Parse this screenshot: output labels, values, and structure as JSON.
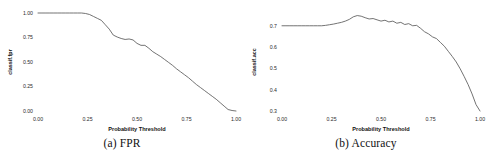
{
  "figure": {
    "panels": [
      {
        "id": "panel-fpr",
        "caption": "(a) FPR",
        "chart_data": {
          "type": "line",
          "title": "",
          "xlabel": "Probability Threshold",
          "ylabel": "classif.fpr",
          "xlim": [
            0.0,
            1.0
          ],
          "ylim": [
            0.0,
            1.0
          ],
          "xticks": [
            0.0,
            0.25,
            0.5,
            0.75,
            1.0
          ],
          "xticklabels": [
            "0.00",
            "0.25",
            "0.50",
            "0.75",
            "1.00"
          ],
          "yticks": [
            0.0,
            0.25,
            0.5,
            0.75,
            1.0
          ],
          "yticklabels": [
            "0.00",
            "0.25",
            "0.50",
            "0.75",
            "1.00"
          ],
          "grid": false,
          "legend": "none",
          "line_color": "#5a5a5a",
          "series": [
            {
              "name": "classif.fpr",
              "x": [
                0.0,
                0.02,
                0.04,
                0.06,
                0.08,
                0.1,
                0.12,
                0.14,
                0.16,
                0.18,
                0.2,
                0.22,
                0.24,
                0.26,
                0.28,
                0.3,
                0.32,
                0.34,
                0.36,
                0.38,
                0.4,
                0.42,
                0.44,
                0.46,
                0.48,
                0.5,
                0.52,
                0.54,
                0.56,
                0.58,
                0.6,
                0.62,
                0.64,
                0.66,
                0.68,
                0.7,
                0.72,
                0.74,
                0.76,
                0.78,
                0.8,
                0.82,
                0.84,
                0.86,
                0.88,
                0.9,
                0.92,
                0.94,
                0.96,
                0.98,
                1.0
              ],
              "y": [
                1.0,
                1.0,
                1.0,
                1.0,
                1.0,
                1.0,
                1.0,
                1.0,
                1.0,
                1.0,
                1.0,
                1.0,
                0.995,
                0.985,
                0.965,
                0.945,
                0.925,
                0.88,
                0.835,
                0.775,
                0.755,
                0.74,
                0.73,
                0.735,
                0.725,
                0.69,
                0.67,
                0.67,
                0.64,
                0.605,
                0.58,
                0.555,
                0.525,
                0.495,
                0.465,
                0.43,
                0.4,
                0.37,
                0.34,
                0.305,
                0.27,
                0.24,
                0.21,
                0.18,
                0.15,
                0.12,
                0.085,
                0.05,
                0.015,
                0.005,
                0.0
              ]
            }
          ]
        }
      },
      {
        "id": "panel-accuracy",
        "caption": "(b) Accuracy",
        "chart_data": {
          "type": "line",
          "title": "",
          "xlabel": "Probability Threshold",
          "ylabel": "classif.acc",
          "xlim": [
            0.0,
            1.0
          ],
          "ylim": [
            0.3,
            0.76
          ],
          "xticks": [
            0.0,
            0.25,
            0.5,
            0.75,
            1.0
          ],
          "xticklabels": [
            "0.00",
            "0.25",
            "0.50",
            "0.75",
            "1.00"
          ],
          "yticks": [
            0.3,
            0.4,
            0.5,
            0.6,
            0.7
          ],
          "yticklabels": [
            "0.3",
            "0.4",
            "0.5",
            "0.6",
            "0.7"
          ],
          "grid": false,
          "legend": "none",
          "line_color": "#5a5a5a",
          "series": [
            {
              "name": "classif.acc",
              "x": [
                0.0,
                0.02,
                0.04,
                0.06,
                0.08,
                0.1,
                0.12,
                0.14,
                0.16,
                0.18,
                0.2,
                0.22,
                0.24,
                0.26,
                0.28,
                0.3,
                0.32,
                0.34,
                0.36,
                0.38,
                0.4,
                0.42,
                0.44,
                0.46,
                0.48,
                0.5,
                0.52,
                0.54,
                0.56,
                0.58,
                0.6,
                0.62,
                0.64,
                0.66,
                0.68,
                0.7,
                0.72,
                0.74,
                0.76,
                0.78,
                0.8,
                0.82,
                0.84,
                0.86,
                0.88,
                0.9,
                0.92,
                0.94,
                0.96,
                0.98,
                1.0
              ],
              "y": [
                0.7,
                0.7,
                0.7,
                0.7,
                0.7,
                0.7,
                0.7,
                0.7,
                0.7,
                0.7,
                0.7,
                0.702,
                0.705,
                0.708,
                0.712,
                0.716,
                0.722,
                0.73,
                0.742,
                0.748,
                0.745,
                0.738,
                0.732,
                0.734,
                0.728,
                0.722,
                0.726,
                0.718,
                0.722,
                0.712,
                0.716,
                0.706,
                0.71,
                0.7,
                0.702,
                0.688,
                0.672,
                0.662,
                0.648,
                0.64,
                0.622,
                0.604,
                0.58,
                0.556,
                0.53,
                0.498,
                0.462,
                0.424,
                0.38,
                0.33,
                0.3
              ]
            }
          ]
        }
      }
    ]
  }
}
